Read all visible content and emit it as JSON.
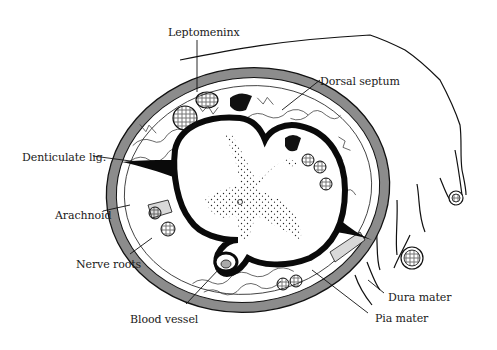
{
  "diagram": {
    "colors": {
      "ink": "#111111",
      "dura_fill": "#8c8c8c",
      "background": "#ffffff",
      "pale_fill": "#d9d9d9"
    },
    "labels": [
      {
        "id": "leptomeninx",
        "text": "Leptomeninx",
        "x": 168,
        "y": 26
      },
      {
        "id": "dorsal-septum",
        "text": "Dorsal septum",
        "x": 320,
        "y": 75
      },
      {
        "id": "denticulate-lig",
        "text": "Denticulate lig.",
        "x": 22,
        "y": 151
      },
      {
        "id": "arachnoid",
        "text": "Arachnoid",
        "x": 55,
        "y": 209
      },
      {
        "id": "nerve-roots",
        "text": "Nerve roots",
        "x": 76,
        "y": 258
      },
      {
        "id": "blood-vessel",
        "text": "Blood vessel",
        "x": 130,
        "y": 313
      },
      {
        "id": "dura-mater",
        "text": "Dura mater",
        "x": 388,
        "y": 291
      },
      {
        "id": "pia-mater",
        "text": "Pia mater",
        "x": 375,
        "y": 312
      }
    ]
  }
}
